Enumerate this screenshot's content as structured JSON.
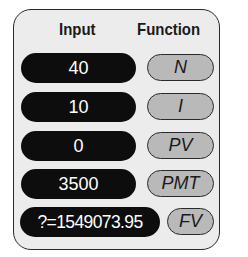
{
  "header": {
    "input_label": "Input",
    "function_label": "Function"
  },
  "rows": [
    {
      "input": "40",
      "function": "N"
    },
    {
      "input": "10",
      "function": "I"
    },
    {
      "input": "0",
      "function": "PV"
    },
    {
      "input": "3500",
      "function": "PMT"
    },
    {
      "input": "?=1549073.95",
      "function": "FV"
    }
  ]
}
